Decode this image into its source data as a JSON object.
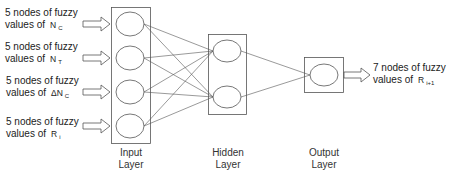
{
  "diagram": {
    "type": "neural-network",
    "colors": {
      "stroke": "#555555",
      "text": "#222222",
      "background": "#ffffff"
    },
    "inputs": [
      {
        "line1": "5 nodes of fuzzy",
        "line2": "values of",
        "symbol": "N",
        "subscript": "C"
      },
      {
        "line1": "5 nodes of fuzzy",
        "line2": "values of",
        "symbol": "N",
        "subscript": "T"
      },
      {
        "line1": "5 nodes of fuzzy",
        "line2": "values of",
        "symbol": "ΔN",
        "subscript": "C"
      },
      {
        "line1": "5 nodes of fuzzy",
        "line2": "values of",
        "symbol": "R",
        "subscript": "i"
      }
    ],
    "output": {
      "line1": "7 nodes of fuzzy",
      "line2": "values of",
      "symbol": "R",
      "subscript": "i+1"
    },
    "layers": {
      "input": {
        "line1": "Input",
        "line2": "Layer",
        "node_count": 4
      },
      "hidden": {
        "line1": "Hidden",
        "line2": "Layer",
        "node_count": 2
      },
      "output": {
        "line1": "Output",
        "line2": "Layer",
        "node_count": 1
      }
    }
  }
}
